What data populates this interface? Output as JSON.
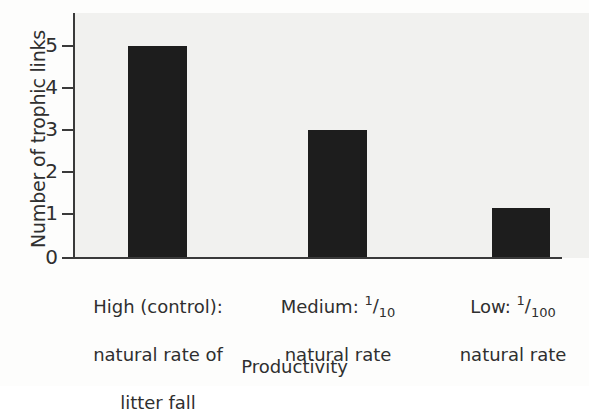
{
  "chart_data": {
    "type": "bar",
    "title": "",
    "subtitle": "",
    "xlabel": "Productivity",
    "ylabel": "Number of trophic links",
    "categories": [
      "High (control): natural rate of litter fall",
      "Medium: 1/10 natural rate",
      "Low: 1/100 natural rate"
    ],
    "values": [
      5.05,
      3.05,
      1.2
    ],
    "ylim": [
      0,
      5.6
    ],
    "yticks": [
      0,
      1,
      2,
      3,
      4,
      5
    ],
    "ytick_labels": [
      "0",
      "1",
      "2",
      "3",
      "4",
      "5"
    ],
    "grid": false,
    "legend": null,
    "bar_color": "#1d1d1d",
    "axis_color": "#3a3a3a",
    "plot_background": "#f1f1ef"
  },
  "axes": {
    "y_title": "Number of trophic links",
    "x_title": "Productivity"
  },
  "categories": [
    {
      "id": "high",
      "line1": "High (control):",
      "line2": "natural rate of",
      "line3": "litter fall",
      "prefix": "",
      "fraction_numerator": "",
      "fraction_denominator": "",
      "value": 5.05
    },
    {
      "id": "medium",
      "line1_prefix": "Medium: ",
      "fraction_numerator": "1",
      "fraction_denominator": "10",
      "line2": "natural rate",
      "value": 3.05
    },
    {
      "id": "low",
      "line1_prefix": "Low: ",
      "fraction_numerator": "1",
      "fraction_denominator": "100",
      "line2": "natural rate",
      "value": 1.2
    }
  ],
  "yticks": [
    {
      "label": "5"
    },
    {
      "label": "4"
    },
    {
      "label": "3"
    },
    {
      "label": "2"
    },
    {
      "label": "1"
    },
    {
      "label": "0"
    }
  ]
}
